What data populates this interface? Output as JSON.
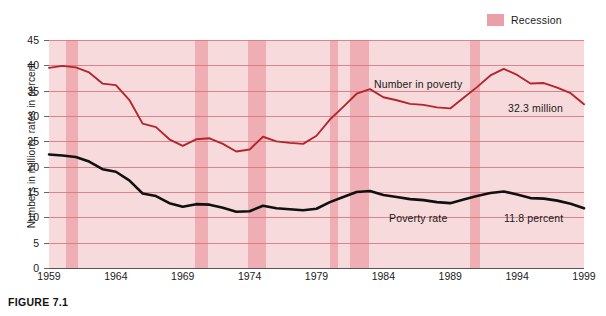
{
  "figure": {
    "caption": "FIGURE 7.1"
  },
  "legend": {
    "items": [
      {
        "label": "Recession",
        "color": "#eeaeb3",
        "icon": "recession-swatch"
      }
    ]
  },
  "annotations": {
    "number_in_poverty": "Number in poverty",
    "poverty_rate": "Poverty rate",
    "number_end_value": "32.3 million",
    "rate_end_value": "11.8 percent"
  },
  "chart_data": {
    "type": "line",
    "title": "",
    "xlabel": "",
    "ylabel": "Numbers in millions, rates in percent",
    "xlim": [
      1959,
      1999
    ],
    "ylim": [
      0,
      45
    ],
    "grid": true,
    "legend_position": "top-right",
    "xticks": [
      1959,
      1964,
      1969,
      1974,
      1979,
      1984,
      1989,
      1994,
      1999
    ],
    "yticks": [
      0,
      5,
      10,
      15,
      20,
      25,
      30,
      35,
      40,
      45
    ],
    "x": [
      1959,
      1960,
      1961,
      1962,
      1963,
      1964,
      1965,
      1966,
      1967,
      1968,
      1969,
      1970,
      1971,
      1972,
      1973,
      1974,
      1975,
      1976,
      1977,
      1978,
      1979,
      1980,
      1981,
      1982,
      1983,
      1984,
      1985,
      1986,
      1987,
      1988,
      1989,
      1990,
      1991,
      1992,
      1993,
      1994,
      1995,
      1996,
      1997,
      1998,
      1999
    ],
    "series": [
      {
        "name": "Number in poverty",
        "units": "millions",
        "color": "#b4252c",
        "end_label": "32.3 million",
        "values": [
          39.5,
          39.9,
          39.6,
          38.6,
          36.4,
          36.1,
          33.2,
          28.5,
          27.8,
          25.4,
          24.1,
          25.4,
          25.6,
          24.5,
          23.0,
          23.4,
          25.9,
          25.0,
          24.7,
          24.5,
          26.1,
          29.3,
          31.8,
          34.4,
          35.3,
          33.7,
          33.1,
          32.4,
          32.2,
          31.7,
          31.5,
          33.6,
          35.7,
          38.0,
          39.3,
          38.1,
          36.4,
          36.5,
          35.6,
          34.5,
          32.3
        ]
      },
      {
        "name": "Poverty rate",
        "units": "percent",
        "color": "#111111",
        "end_label": "11.8 percent",
        "values": [
          22.4,
          22.2,
          21.9,
          21.0,
          19.5,
          19.0,
          17.3,
          14.7,
          14.2,
          12.8,
          12.1,
          12.6,
          12.5,
          11.9,
          11.1,
          11.2,
          12.3,
          11.8,
          11.6,
          11.4,
          11.7,
          13.0,
          14.0,
          15.0,
          15.2,
          14.4,
          14.0,
          13.6,
          13.4,
          13.0,
          12.8,
          13.5,
          14.2,
          14.8,
          15.1,
          14.5,
          13.8,
          13.7,
          13.3,
          12.7,
          11.8
        ]
      }
    ],
    "recession_bands": [
      {
        "start": 1960.3,
        "end": 1961.2
      },
      {
        "start": 1969.9,
        "end": 1970.9
      },
      {
        "start": 1973.9,
        "end": 1975.2
      },
      {
        "start": 1980.0,
        "end": 1980.6
      },
      {
        "start": 1981.5,
        "end": 1982.9
      },
      {
        "start": 1990.5,
        "end": 1991.2
      }
    ]
  }
}
